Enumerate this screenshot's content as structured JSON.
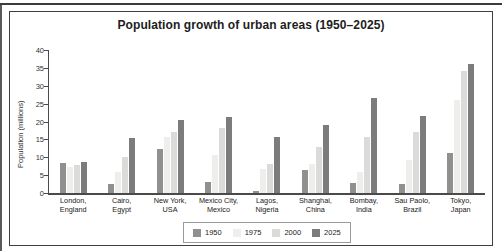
{
  "chart_data": {
    "type": "bar",
    "title": "Population growth of urban areas (1950–2025)",
    "ylabel": "Population (millions)",
    "xlabel": "",
    "ylim": [
      0,
      40
    ],
    "yticks": [
      0,
      5,
      10,
      15,
      20,
      25,
      30,
      35,
      40
    ],
    "grid": false,
    "legend_position": "bottom-center",
    "categories": [
      {
        "city": "London,",
        "country": "England"
      },
      {
        "city": "Cairo,",
        "country": "Egypt"
      },
      {
        "city": "New York,",
        "country": "USA"
      },
      {
        "city": "Mexico City,",
        "country": "Mexico"
      },
      {
        "city": "Lagos,",
        "country": "Nigeria"
      },
      {
        "city": "Shanghai,",
        "country": "China"
      },
      {
        "city": "Bombay,",
        "country": "India"
      },
      {
        "city": "Sau Paolo,",
        "country": "Brazil"
      },
      {
        "city": "Tokyo,",
        "country": "Japan"
      }
    ],
    "series": [
      {
        "name": "1950",
        "color": "#909090",
        "values": [
          8.3,
          2.4,
          12.3,
          3.1,
          0.5,
          6.4,
          2.9,
          2.5,
          11.2
        ]
      },
      {
        "name": "1975",
        "color": "#efeeec",
        "values": [
          7.3,
          6.0,
          15.6,
          10.6,
          6.8,
          8.1,
          5.9,
          9.3,
          26.0
        ]
      },
      {
        "name": "2000",
        "color": "#dbdbd9",
        "values": [
          7.8,
          10.2,
          17.2,
          18.1,
          8.1,
          12.8,
          15.6,
          17.0,
          34.2
        ]
      },
      {
        "name": "2025",
        "color": "#7c7c7c",
        "values": [
          8.6,
          15.5,
          20.4,
          21.4,
          15.6,
          19.1,
          26.6,
          21.5,
          36.2
        ]
      }
    ]
  }
}
